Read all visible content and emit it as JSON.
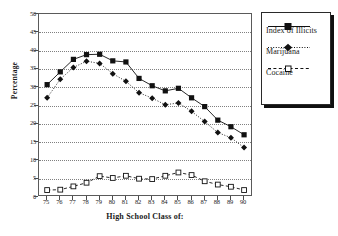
{
  "chart_data": {
    "type": "line",
    "title": "",
    "xlabel": "High School Class of:",
    "ylabel": "Percentage",
    "xlim": [
      75,
      90
    ],
    "ylim": [
      0,
      50
    ],
    "grid": true,
    "legend_position": "right",
    "categories": [
      "75",
      "76",
      "77",
      "78",
      "79",
      "80",
      "81",
      "82",
      "83",
      "84",
      "85",
      "86",
      "87",
      "88",
      "89",
      "90"
    ],
    "x_tick_labels": [
      "75",
      "76",
      "77",
      "78",
      "79",
      "80",
      "81",
      "82",
      "83",
      "84",
      "85",
      "86",
      "87",
      "88",
      "89",
      "90"
    ],
    "y_tick_labels": [
      "0",
      "5",
      "10",
      "15",
      "20",
      "25",
      "30",
      "35",
      "40",
      "45",
      "50"
    ],
    "y_ticks": [
      0,
      5,
      10,
      15,
      20,
      25,
      30,
      35,
      40,
      45,
      50
    ],
    "series": [
      {
        "name": "Index of Illicits",
        "marker": "filled-square",
        "line_style": "solid",
        "values": [
          30.7,
          34.2,
          37.6,
          38.9,
          39.0,
          37.2,
          36.9,
          32.4,
          30.4,
          29.0,
          29.7,
          27.1,
          24.7,
          21.0,
          19.2,
          17.0
        ]
      },
      {
        "name": "Marijuana",
        "marker": "filled-diamond",
        "line_style": "dotted",
        "values": [
          27.1,
          32.2,
          35.4,
          37.1,
          36.5,
          33.7,
          31.6,
          28.5,
          27.0,
          25.2,
          25.7,
          23.4,
          20.6,
          17.6,
          16.2,
          13.5
        ]
      },
      {
        "name": "Cocaine",
        "marker": "open-square",
        "line_style": "dashed",
        "values": [
          1.9,
          2.0,
          2.9,
          3.9,
          5.7,
          5.2,
          5.8,
          5.0,
          4.9,
          5.8,
          6.7,
          6.0,
          4.3,
          3.4,
          2.8,
          1.9
        ]
      }
    ]
  },
  "legend": {
    "entries": [
      {
        "label": "Index of Illicits"
      },
      {
        "label": "Marijuana"
      },
      {
        "label": "Cocaine"
      }
    ]
  },
  "colors": {
    "series": "#111111",
    "grid": "#808080",
    "frame": "#5a5a5a",
    "text": "#1a1a1a",
    "legend_shadow": "#101010"
  }
}
